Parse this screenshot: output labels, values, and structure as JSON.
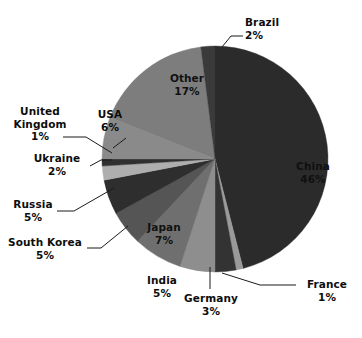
{
  "chart_data": {
    "type": "pie",
    "title": "",
    "subtitle": "",
    "units": "percent",
    "legend_position": "none",
    "grid": false,
    "start_angle_deg": 0,
    "direction": "clockwise",
    "categories": [
      "China",
      "France",
      "Germany",
      "India",
      "Japan",
      "South Korea",
      "Russia",
      "Ukraine",
      "United Kingdom",
      "USA",
      "Other",
      "Brazil"
    ],
    "values": [
      46,
      1,
      3,
      5,
      7,
      5,
      5,
      2,
      1,
      6,
      17,
      2
    ],
    "slices": [
      {
        "name": "China",
        "value": 46,
        "label": "China",
        "pct_label": "46%",
        "color": "#2b2b2b",
        "label_placement": "inside"
      },
      {
        "name": "France",
        "value": 1,
        "label": "France",
        "pct_label": "1%",
        "color": "#9a9a9a",
        "label_placement": "outside"
      },
      {
        "name": "Germany",
        "value": 3,
        "label": "Germany",
        "pct_label": "3%",
        "color": "#333333",
        "label_placement": "outside"
      },
      {
        "name": "India",
        "value": 5,
        "label": "India",
        "pct_label": "5%",
        "color": "#8e8e8e",
        "label_placement": "outside"
      },
      {
        "name": "Japan",
        "value": 7,
        "label": "Japan",
        "pct_label": "7%",
        "color": "#6f6f6f",
        "label_placement": "inside"
      },
      {
        "name": "South Korea",
        "value": 5,
        "label": "South Korea",
        "pct_label": "5%",
        "color": "#555555",
        "label_placement": "outside"
      },
      {
        "name": "Russia",
        "value": 5,
        "label": "Russia",
        "pct_label": "5%",
        "color": "#2e2e2e",
        "label_placement": "outside"
      },
      {
        "name": "Ukraine",
        "value": 2,
        "label": "Ukraine",
        "pct_label": "2%",
        "color": "#aeaeae",
        "label_placement": "outside"
      },
      {
        "name": "United Kingdom",
        "value": 1,
        "label": "United Kingdom",
        "pct_label": "1%",
        "color": "#303030",
        "label_placement": "outside"
      },
      {
        "name": "USA",
        "value": 6,
        "label": "USA",
        "pct_label": "6%",
        "color": "#8a8a8a",
        "label_placement": "outside"
      },
      {
        "name": "Other",
        "value": 17,
        "label": "Other",
        "pct_label": "17%",
        "color": "#7d7d7d",
        "label_placement": "inside"
      },
      {
        "name": "Brazil",
        "value": 2,
        "label": "Brazil",
        "pct_label": "2%",
        "color": "#3a3a3a",
        "label_placement": "outside"
      }
    ]
  },
  "labels": {
    "brazil": {
      "name": "Brazil",
      "pct": "2%"
    },
    "other": {
      "name": "Other",
      "pct": "17%"
    },
    "usa": {
      "name": "USA",
      "pct": "6%"
    },
    "uk": {
      "name": "United",
      "name2": "Kingdom",
      "pct": "1%"
    },
    "ukraine": {
      "name": "Ukraine",
      "pct": "2%"
    },
    "russia": {
      "name": "Russia",
      "pct": "5%"
    },
    "korea": {
      "name": "South Korea",
      "pct": "5%"
    },
    "japan": {
      "name": "Japan",
      "pct": "7%"
    },
    "india": {
      "name": "India",
      "pct": "5%"
    },
    "germany": {
      "name": "Germany",
      "pct": "3%"
    },
    "france": {
      "name": "France",
      "pct": "1%"
    },
    "china": {
      "name": "China",
      "pct": "46%"
    }
  }
}
